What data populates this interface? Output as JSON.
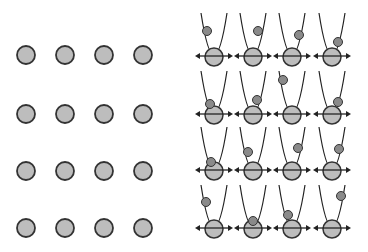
{
  "colors": {
    "background": "#ffffff",
    "atom_fill": "#bdbdbd",
    "atom_stroke": "#333333",
    "ball_fill": "#8a8a8a",
    "line": "#222222"
  },
  "left_panel": {
    "label": "static-lattice",
    "cols_x": [
      26,
      65,
      104,
      143
    ],
    "rows_y": [
      55,
      114,
      171,
      228
    ],
    "radius": 9
  },
  "right_panel": {
    "label": "vibrating-lattice",
    "cols_x": [
      214,
      253,
      292,
      332
    ],
    "rows_y": [
      57,
      115,
      171,
      229
    ],
    "radius": 9,
    "arrow_half_width": 19,
    "ball_offsets": [
      [
        [
          -7,
          -26
        ],
        [
          5,
          -26
        ],
        [
          7,
          -22
        ],
        [
          6,
          -15
        ]
      ],
      [
        [
          -4,
          -11
        ],
        [
          4,
          -15
        ],
        [
          -9,
          -35
        ],
        [
          6,
          -13
        ]
      ],
      [
        [
          -3,
          -9
        ],
        [
          -5,
          -19
        ],
        [
          6,
          -23
        ],
        [
          7,
          -22
        ]
      ],
      [
        [
          -8,
          -27
        ],
        [
          0,
          -8
        ],
        [
          -4,
          -14
        ],
        [
          9,
          -33
        ]
      ]
    ]
  }
}
